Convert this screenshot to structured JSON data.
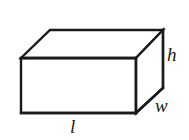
{
  "figure": {
    "name": "rectangular-prism-diagram",
    "background_color": "#ffffff",
    "stroke_color": "#1a1a1a",
    "stroke_width": 2.2,
    "labels": {
      "height": "h",
      "width": "w",
      "length": "l"
    },
    "geometry": {
      "front_top_left": [
        21,
        58
      ],
      "front_top_right": [
        136,
        58
      ],
      "front_bottom_left": [
        21,
        113
      ],
      "front_bottom_right": [
        136,
        113
      ],
      "back_top_left": [
        50,
        30
      ],
      "back_top_right": [
        163,
        30
      ],
      "back_bottom_right": [
        163,
        88
      ],
      "front_face": "21,58 136,58 136,113 21,113",
      "top_face": "21,58 50,30 163,30 136,58",
      "right_face": "136,58 163,30 163,88 136,113"
    }
  }
}
